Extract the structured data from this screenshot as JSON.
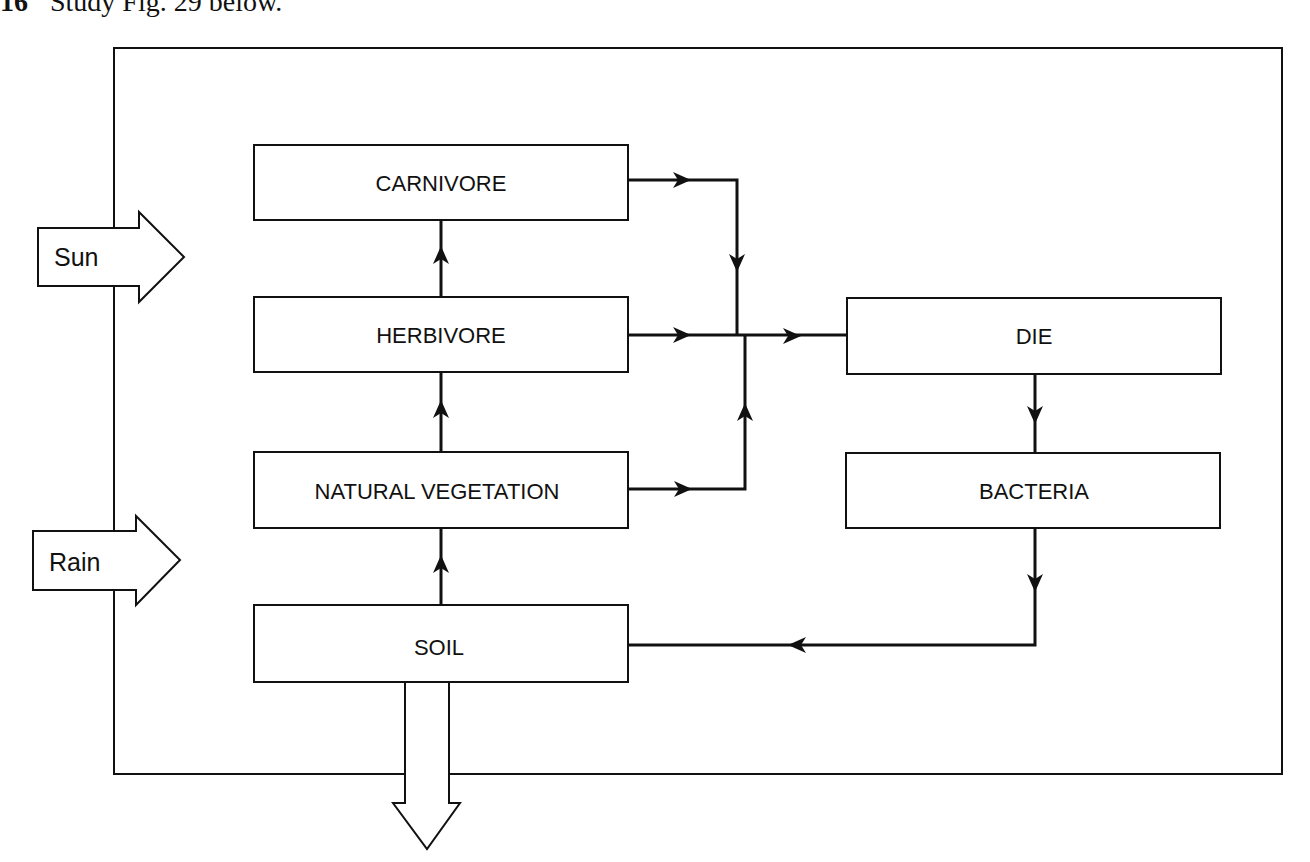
{
  "question": {
    "number": "16",
    "prompt": "Study Fig. 29 below."
  },
  "diagram": {
    "colors": {
      "ink": "#111111",
      "paper": "#ffffff"
    },
    "inputs": [
      {
        "id": "sun",
        "label": "Sun"
      },
      {
        "id": "rain",
        "label": "Rain"
      }
    ],
    "output": {
      "id": "soil-out",
      "label": "SOIL"
    },
    "nodes": [
      {
        "id": "carnivore",
        "label": "CARNIVORE"
      },
      {
        "id": "herbivore",
        "label": "HERBIVORE"
      },
      {
        "id": "vegetation",
        "label": "NATURAL VEGETATION"
      },
      {
        "id": "soil",
        "label": "SOIL"
      },
      {
        "id": "die",
        "label": "DIE"
      },
      {
        "id": "bacteria",
        "label": "BACTERIA"
      }
    ],
    "edges": [
      {
        "from": "soil",
        "to": "vegetation"
      },
      {
        "from": "vegetation",
        "to": "herbivore"
      },
      {
        "from": "herbivore",
        "to": "carnivore"
      },
      {
        "from": "carnivore",
        "to": "die"
      },
      {
        "from": "herbivore",
        "to": "die"
      },
      {
        "from": "vegetation",
        "to": "die"
      },
      {
        "from": "die",
        "to": "bacteria"
      },
      {
        "from": "bacteria",
        "to": "soil"
      }
    ]
  }
}
